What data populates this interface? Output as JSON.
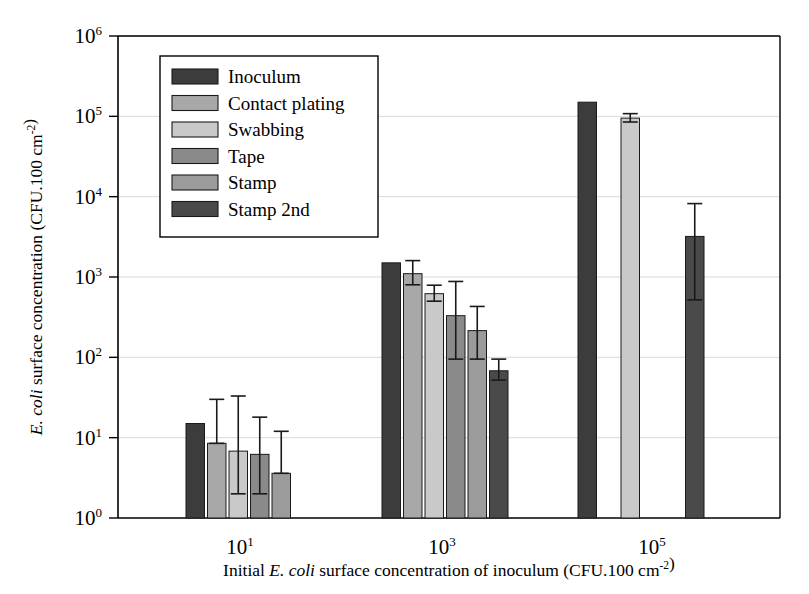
{
  "chart_data": {
    "type": "bar",
    "title": "",
    "subtitle": "",
    "xlabel_parts": [
      {
        "text": "Initial ",
        "style": "normal"
      },
      {
        "text": "E. coli",
        "style": "italic"
      },
      {
        "text": " surface concentration of inoculum (CFU.100 cm",
        "style": "normal"
      },
      {
        "text": "-2",
        "style": "superscript"
      },
      {
        "text": ")",
        "style": "normal"
      }
    ],
    "xlabel": "Initial E. coli surface concentration of inoculum (CFU.100 cm-2)",
    "ylabel_parts": [
      {
        "text": "E. coli",
        "style": "italic"
      },
      {
        "text": " surface concentration (CFU.100 cm",
        "style": "normal"
      },
      {
        "text": "-2",
        "style": "superscript"
      },
      {
        "text": ")",
        "style": "normal"
      }
    ],
    "ylabel": "E. coli surface concentration (CFU.100 cm-2)",
    "yscale": "log",
    "ylim": [
      1,
      1000000
    ],
    "ytick_labels": [
      "10⁰",
      "10¹",
      "10²",
      "10³",
      "10⁴",
      "10⁵",
      "10⁶"
    ],
    "ytick_mantissa": [
      "10",
      "10",
      "10",
      "10",
      "10",
      "10",
      "10"
    ],
    "ytick_exponents": [
      "0",
      "1",
      "2",
      "3",
      "4",
      "5",
      "6"
    ],
    "ytick_values": [
      1,
      10,
      100,
      1000,
      10000,
      100000,
      1000000
    ],
    "grid": "horizontal",
    "legend_position": "upper-left-inside",
    "categories": [
      "10¹",
      "10³",
      "10⁵"
    ],
    "category_exponents": [
      "1",
      "3",
      "5"
    ],
    "category_mantissa": [
      "10",
      "10",
      "10"
    ],
    "series": [
      {
        "name": "Inoculum",
        "color": "#3c3c3c",
        "values": [
          15,
          1500,
          150000
        ],
        "err_low": [
          null,
          null,
          null
        ],
        "err_high": [
          null,
          null,
          null
        ]
      },
      {
        "name": "Contact plating",
        "color": "#a8a8a8",
        "values": [
          8.5,
          1100,
          null
        ],
        "err_low": [
          8.5,
          800,
          null
        ],
        "err_high": [
          30,
          1600,
          null
        ]
      },
      {
        "name": "Swabbing",
        "color": "#c9c9c9",
        "values": [
          6.8,
          620,
          95000
        ],
        "err_low": [
          2.0,
          500,
          85000
        ],
        "err_high": [
          33,
          790,
          108000
        ]
      },
      {
        "name": "Tape",
        "color": "#8a8a8a",
        "values": [
          6.2,
          330,
          null
        ],
        "err_low": [
          2.0,
          95,
          null
        ],
        "err_high": [
          18,
          880,
          null
        ]
      },
      {
        "name": "Stamp",
        "color": "#9b9b9b",
        "values": [
          3.6,
          215,
          null
        ],
        "err_low": [
          3.6,
          95,
          null
        ],
        "err_high": [
          12,
          430,
          null
        ]
      },
      {
        "name": "Stamp 2nd",
        "color": "#4a4a4a",
        "values": [
          null,
          68,
          3200
        ],
        "err_low": [
          null,
          52,
          520
        ],
        "err_high": [
          null,
          95,
          8200
        ]
      }
    ]
  },
  "legend": {
    "items": [
      {
        "label": "Inoculum",
        "color": "#3c3c3c"
      },
      {
        "label": "Contact plating",
        "color": "#a8a8a8"
      },
      {
        "label": "Swabbing",
        "color": "#c9c9c9"
      },
      {
        "label": "Tape",
        "color": "#8a8a8a"
      },
      {
        "label": "Stamp",
        "color": "#9b9b9b"
      },
      {
        "label": "Stamp 2nd",
        "color": "#4a4a4a"
      }
    ]
  },
  "colors": {
    "background": "#ffffff",
    "axis": "#000000",
    "grid": "#d9d9d9",
    "bar_outline": "#1a1a1a"
  }
}
